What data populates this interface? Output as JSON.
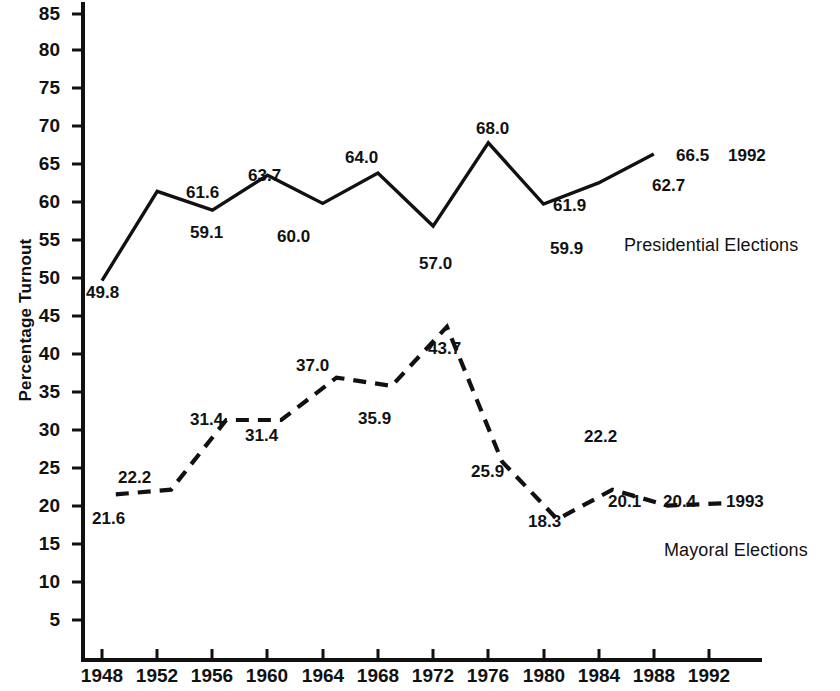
{
  "chart_data": {
    "type": "line",
    "title": "",
    "xlabel": "",
    "ylabel": "Percentage Turnout",
    "ylim": [
      0,
      87
    ],
    "xlim": [
      1946.5,
      1994
    ],
    "grid": false,
    "legend_position": "inline-right",
    "y_ticks": [
      5,
      10,
      15,
      20,
      25,
      30,
      35,
      40,
      45,
      50,
      55,
      60,
      65,
      70,
      75,
      80,
      85
    ],
    "x_ticks": [
      1948,
      1952,
      1956,
      1960,
      1964,
      1968,
      1972,
      1976,
      1980,
      1984,
      1988,
      1992
    ],
    "series": [
      {
        "name": "Presidential Elections",
        "style": "solid",
        "color": "#000000",
        "x": [
          1948,
          1952,
          1956,
          1960,
          1964,
          1968,
          1972,
          1976,
          1980,
          1984,
          1988
        ],
        "values": [
          49.8,
          61.6,
          59.1,
          63.7,
          60.0,
          64.0,
          57.0,
          68.0,
          59.9,
          62.7,
          66.5
        ],
        "end_annotation": "1992"
      },
      {
        "name": "Mayoral Elections",
        "style": "dashed",
        "color": "#000000",
        "x": [
          1949,
          1953,
          1957,
          1961,
          1965,
          1969,
          1973,
          1977,
          1981,
          1985,
          1989
        ],
        "values": [
          21.6,
          22.2,
          31.4,
          31.4,
          37.0,
          35.9,
          43.7,
          25.9,
          18.3,
          22.2,
          20.1
        ],
        "last_point_value": 20.4,
        "end_annotation": "1993"
      }
    ]
  },
  "axis": {
    "y_title": "Percentage Turnout",
    "y_tick_labels": [
      "85",
      "80",
      "75",
      "70",
      "65",
      "60",
      "55",
      "50",
      "45",
      "40",
      "35",
      "30",
      "25",
      "20",
      "15",
      "10",
      "5"
    ],
    "x_tick_labels": [
      "1948",
      "1952",
      "1956",
      "1960",
      "1964",
      "1968",
      "1972",
      "1976",
      "1980",
      "1984",
      "1988",
      "1992"
    ]
  },
  "presidential": {
    "legend_label": "Presidential Elections",
    "end_year": "1992",
    "labels": [
      "49.8",
      "61.6",
      "59.1",
      "63.7",
      "60.0",
      "64.0",
      "57.0",
      "68.0",
      "61.9",
      "59.9",
      "62.7",
      "66.5"
    ]
  },
  "mayoral": {
    "legend_label": "Mayoral Elections",
    "end_year": "1993",
    "labels": [
      "21.6",
      "22.2",
      "31.4",
      "31.4",
      "37.0",
      "35.9",
      "43.7",
      "25.9",
      "18.3",
      "22.2",
      "20.1",
      "20.4"
    ]
  },
  "point_labels": {
    "pres": [
      {
        "text": "49.8",
        "x": 86,
        "y": 284
      },
      {
        "text": "61.6",
        "x": 186,
        "y": 184
      },
      {
        "text": "59.1",
        "x": 190,
        "y": 224
      },
      {
        "text": "63.7",
        "x": 248,
        "y": 167
      },
      {
        "text": "60.0",
        "x": 277,
        "y": 228
      },
      {
        "text": "64.0",
        "x": 345,
        "y": 149
      },
      {
        "text": "57.0",
        "x": 419,
        "y": 255
      },
      {
        "text": "68.0",
        "x": 476,
        "y": 120
      },
      {
        "text": "61.9",
        "x": 553,
        "y": 197
      },
      {
        "text": "59.9",
        "x": 550,
        "y": 240
      },
      {
        "text": "62.7",
        "x": 652,
        "y": 177
      },
      {
        "text": "66.5",
        "x": 676,
        "y": 147
      }
    ],
    "may": [
      {
        "text": "21.6",
        "x": 92,
        "y": 510
      },
      {
        "text": "22.2",
        "x": 118,
        "y": 469
      },
      {
        "text": "31.4",
        "x": 190,
        "y": 411
      },
      {
        "text": "31.4",
        "x": 245,
        "y": 427
      },
      {
        "text": "37.0",
        "x": 296,
        "y": 357
      },
      {
        "text": "35.9",
        "x": 358,
        "y": 410
      },
      {
        "text": "43.7",
        "x": 428,
        "y": 340
      },
      {
        "text": "25.9",
        "x": 471,
        "y": 463
      },
      {
        "text": "18.3",
        "x": 528,
        "y": 513
      },
      {
        "text": "22.2",
        "x": 584,
        "y": 428
      },
      {
        "text": "20.1",
        "x": 608,
        "y": 493
      },
      {
        "text": "20.4",
        "x": 663,
        "y": 493
      }
    ]
  },
  "annotations": {
    "pres_end_year": {
      "text": "1992",
      "x": 728,
      "y": 147
    },
    "may_end_year": {
      "text": "1993",
      "x": 726,
      "y": 493
    },
    "pres_legend": {
      "text": "Presidential Elections",
      "x": 624,
      "y": 236
    },
    "may_legend": {
      "text": "Mayoral Elections",
      "x": 664,
      "y": 541
    }
  },
  "geometry": {
    "y_axis_x": 83,
    "x_axis_y": 660,
    "x_axis_right": 762,
    "y_axis_top": 2,
    "tick_labels_y": [
      {
        "label": "85",
        "y": 4
      },
      {
        "label": "80",
        "y": 40
      },
      {
        "label": "75",
        "y": 78
      },
      {
        "label": "70",
        "y": 116
      },
      {
        "label": "65",
        "y": 154
      },
      {
        "label": "60",
        "y": 192
      },
      {
        "label": "55",
        "y": 230
      },
      {
        "label": "50",
        "y": 268
      },
      {
        "label": "45",
        "y": 306
      },
      {
        "label": "40",
        "y": 344
      },
      {
        "label": "35",
        "y": 382
      },
      {
        "label": "30",
        "y": 420
      },
      {
        "label": "25",
        "y": 458
      },
      {
        "label": "20",
        "y": 496
      },
      {
        "label": "15",
        "y": 534
      },
      {
        "label": "10",
        "y": 572
      },
      {
        "label": "5",
        "y": 610
      }
    ],
    "tick_labels_x": [
      {
        "label": "1948",
        "x": 70
      },
      {
        "label": "1952",
        "x": 125
      },
      {
        "label": "1956",
        "x": 180
      },
      {
        "label": "1960",
        "x": 235
      },
      {
        "label": "1964",
        "x": 291
      },
      {
        "label": "1968",
        "x": 346
      },
      {
        "label": "1972",
        "x": 401
      },
      {
        "label": "1976",
        "x": 456
      },
      {
        "label": "1980",
        "x": 512
      },
      {
        "label": "1984",
        "x": 567
      },
      {
        "label": "1988",
        "x": 622
      },
      {
        "label": "1992",
        "x": 677
      }
    ]
  }
}
